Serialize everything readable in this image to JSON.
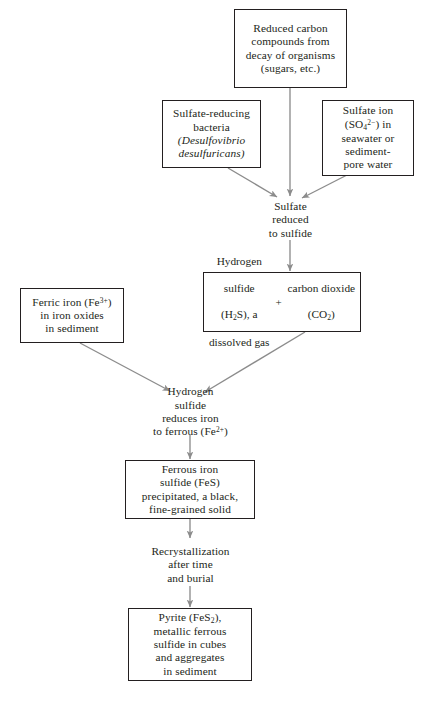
{
  "diagram": {
    "arrow_color": "#8c8c8c",
    "box_border_color": "#231f20",
    "text_color": "#231f20",
    "background_color": "#ffffff",
    "nodes": [
      {
        "id": "reduced-carbon",
        "type": "boxed",
        "text": "Reduced carbon\ncompounds from\ndecay of organisms\n(sugars, etc.)"
      },
      {
        "id": "sulfate-reducing-bacteria",
        "type": "boxed",
        "text_line1": "Sulfate-reducing",
        "text_line2": "bacteria",
        "species_line1": "(Desulfovibrio",
        "species_line2": "desulfuricans)"
      },
      {
        "id": "sulfate-ion",
        "type": "boxed",
        "line1": "Sulfate ion",
        "line2_pre": "(SO",
        "line2_sub": "4",
        "line2_sup": "2−",
        "line2_post": ") in",
        "line3": "seawater or",
        "line4": "sediment-",
        "line5": "pore water"
      },
      {
        "id": "sulfate-reduced",
        "type": "plain",
        "text": "Sulfate\nreduced\nto sulfide"
      },
      {
        "id": "hydrogen-sulfide-gas",
        "type": "combo-left",
        "line1": "Hydrogen",
        "line2": "sulfide",
        "line3_pre": "(H",
        "line3_sub": "2",
        "line3_post": "S), a",
        "line4": "dissolved gas"
      },
      {
        "id": "carbon-dioxide",
        "type": "combo-right",
        "line1": "carbon  dioxide",
        "line2_pre": "(CO",
        "line2_sub": "2",
        "line2_post": ")"
      },
      {
        "id": "plus-sign",
        "type": "symbol",
        "text": "+"
      },
      {
        "id": "ferric-iron",
        "type": "boxed",
        "line1_pre": "Ferric iron (Fe",
        "line1_sup": "3+",
        "line1_post": ")",
        "line2": "in iron oxides",
        "line3": "in sediment"
      },
      {
        "id": "hydrogen-sulfide-reduces-iron",
        "type": "plain",
        "line1": "Hydrogen",
        "line2": "sulfide",
        "line3": "reduces iron",
        "line4_pre": "to ferrous (Fe",
        "line4_sup": "2+",
        "line4_post": ")"
      },
      {
        "id": "ferrous-iron-sulfide",
        "type": "boxed",
        "line1": "Ferrous iron",
        "line2": "sulfide (FeS)",
        "line3": "precipitated, a black,",
        "line4": "fine-grained solid"
      },
      {
        "id": "recrystallization",
        "type": "plain",
        "text": "Recrystallization\nafter time\nand burial"
      },
      {
        "id": "pyrite",
        "type": "boxed",
        "line1_pre": "Pyrite (FeS",
        "line1_sub": "2",
        "line1_post": "),",
        "line2": "metallic ferrous",
        "line3": "sulfide in cubes",
        "line4": "and aggregates",
        "line5": "in sediment"
      }
    ],
    "edges": [
      {
        "id": "edge-carbon-to-sulfate-reduced",
        "from": "reduced-carbon",
        "to": "sulfate-reduced",
        "style": "vertical-arrow"
      },
      {
        "id": "edge-bacteria-to-sulfate-reduced",
        "from": "sulfate-reducing-bacteria",
        "to": "sulfate-reduced",
        "style": "diagonal-arrow"
      },
      {
        "id": "edge-sulfate-ion-to-sulfate-reduced",
        "from": "sulfate-ion",
        "to": "sulfate-reduced",
        "style": "diagonal-arrow"
      },
      {
        "id": "edge-sulfate-reduced-to-products",
        "from": "sulfate-reduced",
        "to": "hydrogen-sulfide-gas",
        "style": "vertical-arrow"
      },
      {
        "id": "edge-ferric-iron-to-reduction",
        "from": "ferric-iron",
        "to": "hydrogen-sulfide-reduces-iron",
        "style": "diagonal-arrow"
      },
      {
        "id": "edge-h2s-to-reduction",
        "from": "hydrogen-sulfide-gas",
        "to": "hydrogen-sulfide-reduces-iron",
        "style": "diagonal-arrow"
      },
      {
        "id": "edge-reduction-to-fes",
        "from": "hydrogen-sulfide-reduces-iron",
        "to": "ferrous-iron-sulfide",
        "style": "vertical-arrow"
      },
      {
        "id": "edge-fes-to-recrystallization",
        "from": "ferrous-iron-sulfide",
        "to": "recrystallization",
        "style": "vertical-arrow"
      },
      {
        "id": "edge-recrystallization-to-pyrite",
        "from": "recrystallization",
        "to": "pyrite",
        "style": "vertical-arrow"
      }
    ]
  }
}
